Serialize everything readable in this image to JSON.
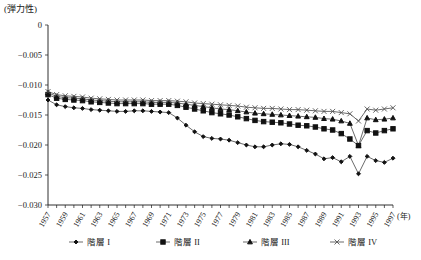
{
  "chart_data": {
    "type": "line",
    "title": "",
    "ylabel": "(弾力性)",
    "xlabel": "(年)",
    "ylim": [
      -0.03,
      0.0
    ],
    "ytick_labels": [
      "0",
      "-0.005",
      "-0.010",
      "-0.015",
      "-0.020",
      "-0.025",
      "-0.030"
    ],
    "ytick_values": [
      0,
      -0.005,
      -0.01,
      -0.015,
      -0.02,
      -0.025,
      -0.03
    ],
    "grid": false,
    "legend_position": "bottom",
    "x": [
      1957,
      1958,
      1959,
      1960,
      1961,
      1962,
      1963,
      1964,
      1965,
      1966,
      1967,
      1968,
      1969,
      1970,
      1971,
      1972,
      1973,
      1974,
      1975,
      1976,
      1977,
      1978,
      1979,
      1980,
      1981,
      1982,
      1983,
      1984,
      1985,
      1986,
      1987,
      1988,
      1989,
      1990,
      1991,
      1992,
      1993,
      1994,
      1995,
      1996,
      1997
    ],
    "xtick_labels": [
      "1957",
      "1959",
      "1961",
      "1963",
      "1965",
      "1967",
      "1969",
      "1971",
      "1973",
      "1975",
      "1977",
      "1979",
      "1981",
      "1983",
      "1985",
      "1987",
      "1989",
      "1991",
      "1993",
      "1995",
      "1997"
    ],
    "series": [
      {
        "name": "階層 I",
        "marker": "diamond",
        "values": [
          -0.0125,
          -0.0133,
          -0.0136,
          -0.0138,
          -0.0139,
          -0.0141,
          -0.0142,
          -0.0143,
          -0.0144,
          -0.0144,
          -0.0143,
          -0.0143,
          -0.0144,
          -0.0145,
          -0.0146,
          -0.0155,
          -0.0167,
          -0.0178,
          -0.0186,
          -0.0189,
          -0.019,
          -0.0192,
          -0.0196,
          -0.02,
          -0.0203,
          -0.0203,
          -0.02,
          -0.0198,
          -0.0199,
          -0.0203,
          -0.0209,
          -0.0215,
          -0.0223,
          -0.0221,
          -0.0228,
          -0.0219,
          -0.0248,
          -0.0219,
          -0.0226,
          -0.0229,
          -0.0222
        ]
      },
      {
        "name": "階層 II",
        "marker": "square",
        "values": [
          -0.0116,
          -0.0122,
          -0.0124,
          -0.0125,
          -0.0126,
          -0.0128,
          -0.0129,
          -0.013,
          -0.0131,
          -0.0131,
          -0.0131,
          -0.0131,
          -0.0132,
          -0.0132,
          -0.0132,
          -0.0134,
          -0.0137,
          -0.014,
          -0.0143,
          -0.0146,
          -0.0148,
          -0.015,
          -0.0153,
          -0.0156,
          -0.0159,
          -0.0161,
          -0.0162,
          -0.0163,
          -0.0165,
          -0.0167,
          -0.0168,
          -0.017,
          -0.0173,
          -0.0175,
          -0.0181,
          -0.019,
          -0.0201,
          -0.0176,
          -0.018,
          -0.0176,
          -0.0173
        ]
      },
      {
        "name": "階層 III",
        "marker": "triangle",
        "values": [
          -0.0113,
          -0.0119,
          -0.0121,
          -0.0122,
          -0.0123,
          -0.0125,
          -0.0126,
          -0.0127,
          -0.0128,
          -0.0128,
          -0.0128,
          -0.0128,
          -0.0129,
          -0.0129,
          -0.0129,
          -0.013,
          -0.0132,
          -0.0134,
          -0.0136,
          -0.0138,
          -0.014,
          -0.0141,
          -0.0143,
          -0.0145,
          -0.0147,
          -0.0148,
          -0.0149,
          -0.015,
          -0.0151,
          -0.0152,
          -0.0153,
          -0.0154,
          -0.0156,
          -0.0157,
          -0.016,
          -0.0164,
          -0.0201,
          -0.0155,
          -0.0158,
          -0.0157,
          -0.0155
        ]
      },
      {
        "name": "階層 IV",
        "marker": "cross",
        "values": [
          -0.0111,
          -0.0116,
          -0.0118,
          -0.0119,
          -0.012,
          -0.0122,
          -0.0123,
          -0.0124,
          -0.0125,
          -0.0125,
          -0.0125,
          -0.0125,
          -0.0126,
          -0.0126,
          -0.0126,
          -0.0127,
          -0.0128,
          -0.013,
          -0.0131,
          -0.0132,
          -0.0133,
          -0.0134,
          -0.0135,
          -0.0137,
          -0.0138,
          -0.0139,
          -0.0139,
          -0.014,
          -0.0141,
          -0.0141,
          -0.0142,
          -0.0143,
          -0.0144,
          -0.0144,
          -0.0146,
          -0.0148,
          -0.016,
          -0.014,
          -0.0142,
          -0.014,
          -0.0138
        ]
      }
    ]
  },
  "legend": {
    "items": [
      {
        "label": "階層 I"
      },
      {
        "label": "階層 II"
      },
      {
        "label": "階層 III"
      },
      {
        "label": "階層 IV"
      }
    ]
  }
}
